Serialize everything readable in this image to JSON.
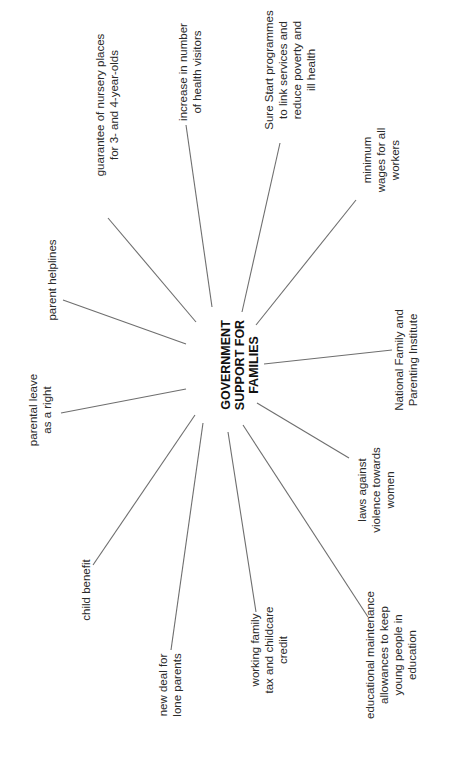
{
  "diagram": {
    "title": "GOVERNMENT\nSUPPORT FOR\nFAMILIES",
    "orientation": "rotated 90° counter-clockwise",
    "line_color": "#6e6e6e",
    "center": {
      "x": 240,
      "y": 365
    },
    "nodes": [
      {
        "id": "guarantee",
        "label": "guarantee of nursery places\nfor 3- and 4-year-olds",
        "x": 107,
        "y": 105,
        "line": [
          108,
          218,
          196,
          322
        ]
      },
      {
        "id": "health-visitors",
        "label": "increase in number\nof health visitors",
        "x": 190,
        "y": 72,
        "line": [
          186,
          125,
          212,
          307
        ]
      },
      {
        "id": "sure-start",
        "label": "Sure Start programmes\nto link services and\nreduce poverty and\nill health",
        "x": 290,
        "y": 70,
        "line": [
          280,
          143,
          242,
          312
        ]
      },
      {
        "id": "minimum-wages",
        "label": "minimum\nwages for all\nworkers",
        "x": 381,
        "y": 160,
        "line": [
          356,
          200,
          256,
          325
        ]
      },
      {
        "id": "national-family",
        "label": "National Family and\nParenting Institute",
        "x": 406,
        "y": 360,
        "line": [
          392,
          350,
          264,
          364
        ]
      },
      {
        "id": "laws-violence",
        "label": "laws against\nviolence towards\nwomen",
        "x": 376,
        "y": 490,
        "line": [
          349,
          458,
          257,
          403
        ]
      },
      {
        "id": "educational",
        "label": "educational maintenance\nallowances to keep\nyoung people in\neducation",
        "x": 391,
        "y": 655,
        "line": [
          368,
          617,
          243,
          425
        ]
      },
      {
        "id": "working-family",
        "label": "working family\ntax and childcare\ncredit",
        "x": 269,
        "y": 650,
        "line": [
          256,
          612,
          228,
          432
        ]
      },
      {
        "id": "new-deal",
        "label": "new deal for\nlone parents",
        "x": 170,
        "y": 685,
        "line": [
          171,
          650,
          203,
          423
        ]
      },
      {
        "id": "child-benefit",
        "label": "child benefit",
        "x": 86,
        "y": 590,
        "line": [
          93,
          565,
          195,
          415
        ]
      },
      {
        "id": "parental-leave",
        "label": "parental leave\nas a right",
        "x": 40,
        "y": 410,
        "line": [
          61,
          413,
          186,
          389
        ]
      },
      {
        "id": "parent-helplines",
        "label": "parent helplines",
        "x": 52,
        "y": 280,
        "line": [
          63,
          300,
          186,
          344
        ]
      }
    ]
  }
}
